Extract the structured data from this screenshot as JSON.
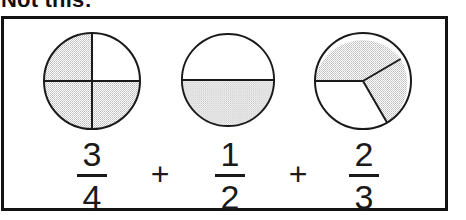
{
  "caption": {
    "text": "Not this:"
  },
  "figure": {
    "border_color": "#131313",
    "background": "#ffffff",
    "shade_color": "#d6d6d6",
    "stroke_color": "#1a1a1a"
  },
  "diagrams": [
    {
      "name": "circle-three-quarters",
      "label": "3/4",
      "parts": 4,
      "shaded": 3,
      "division": "quarters",
      "shaded_sectors": [
        "top-left",
        "bottom-left",
        "bottom-right"
      ],
      "unshaded_sectors": [
        "top-right"
      ]
    },
    {
      "name": "circle-one-half",
      "label": "1/2",
      "parts": 2,
      "shaded": 1,
      "division": "halves",
      "shaded_sectors": [
        "bottom"
      ],
      "unshaded_sectors": [
        "top"
      ]
    },
    {
      "name": "circle-two-thirds",
      "label": "2/3",
      "parts": 3,
      "shaded": 2,
      "division": "thirds",
      "shaded_sectors": [
        "upper-left",
        "right"
      ],
      "unshaded_sectors": [
        "bottom-left"
      ]
    }
  ],
  "equation": {
    "terms": [
      {
        "numerator": "3",
        "denominator": "4"
      },
      {
        "numerator": "1",
        "denominator": "2"
      },
      {
        "numerator": "2",
        "denominator": "3"
      }
    ],
    "operators": [
      "+",
      "+"
    ]
  }
}
